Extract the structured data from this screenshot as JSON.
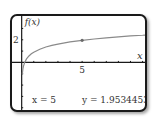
{
  "window": {
    "ylabel": "f(x)",
    "xlabel": "x"
  },
  "readout": {
    "x_text": "x = 5",
    "y_text": "y = 1.9534453"
  },
  "chart_data": {
    "type": "line",
    "title": "",
    "xlabel": "x",
    "ylabel": "f(x)",
    "xlim": [
      -0.8,
      10.2
    ],
    "ylim": [
      -4.2,
      4.1
    ],
    "x_ticks": [
      1,
      2,
      3,
      4,
      5,
      6,
      7,
      8,
      9,
      10
    ],
    "x_tick_labels": {
      "5": "5"
    },
    "y_ticks": [
      -4,
      -3,
      -2,
      -1,
      1,
      2,
      3
    ],
    "y_tick_labels": {
      "2": "2"
    },
    "grid": false,
    "curve": {
      "name": "f(x)",
      "x": [
        0.05,
        0.1,
        0.15,
        0.25,
        0.4,
        0.6,
        0.8,
        1,
        1.5,
        2,
        2.5,
        3,
        4,
        5,
        6,
        7,
        8,
        9,
        10,
        10.2
      ],
      "y": [
        -1.05,
        -0.6,
        -0.33,
        0,
        0.31,
        0.57,
        0.76,
        0.9,
        1.17,
        1.36,
        1.5,
        1.62,
        1.81,
        1.95,
        2.07,
        2.17,
        2.26,
        2.34,
        2.4,
        2.42
      ]
    },
    "trace_point": {
      "x": 5,
      "y": 1.9534453
    },
    "colors": {
      "curve": "#8a8a8a",
      "axis": "#1a1a1a",
      "frame": "#1a1a1a"
    }
  }
}
